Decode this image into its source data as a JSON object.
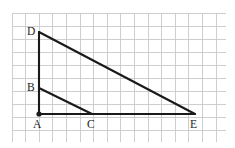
{
  "figure": {
    "background_color": "#ffffff",
    "line_color": "#1a1a1a",
    "grid_color": "#c9c9cc",
    "label_color": "#1d1d1d",
    "grid": {
      "visible": true,
      "x_start": 12,
      "y_start": 13,
      "x_end": 226,
      "y_end": 142,
      "cell_width": 13.6,
      "cell_height": 13.0,
      "columns": 16,
      "rows": 10
    },
    "points": [
      {
        "name": "A",
        "x": 39,
        "y": 114,
        "label": "A",
        "label_x": 33,
        "label_y": 128,
        "marker": "filled-dot",
        "marker_radius": 2.6
      },
      {
        "name": "B",
        "x": 39,
        "y": 88,
        "label": "B",
        "label_x": 27,
        "label_y": 91,
        "marker": "none",
        "marker_radius": 0
      },
      {
        "name": "C",
        "x": 92,
        "y": 114,
        "label": "C",
        "label_x": 87,
        "label_y": 128,
        "marker": "none",
        "marker_radius": 0
      },
      {
        "name": "D",
        "x": 39,
        "y": 32,
        "label": "D",
        "label_x": 27,
        "label_y": 35,
        "marker": "none",
        "marker_radius": 0
      },
      {
        "name": "E",
        "x": 195,
        "y": 114,
        "label": "E",
        "label_x": 190,
        "label_y": 128,
        "marker": "none",
        "marker_radius": 0
      }
    ],
    "segments": [
      {
        "name": "segment-A-D",
        "from": "A",
        "to": "D",
        "x1": 39,
        "y1": 114,
        "x2": 39,
        "y2": 32
      },
      {
        "name": "segment-D-E",
        "from": "D",
        "to": "E",
        "x1": 39,
        "y1": 32,
        "x2": 195,
        "y2": 114
      },
      {
        "name": "segment-A-E",
        "from": "A",
        "to": "E",
        "x1": 39,
        "y1": 114,
        "x2": 195,
        "y2": 114
      },
      {
        "name": "segment-B-C",
        "from": "B",
        "to": "C",
        "x1": 39,
        "y1": 88,
        "x2": 92,
        "y2": 114
      }
    ],
    "triangles": [
      {
        "name": "large-triangle",
        "vertices": "A D E"
      },
      {
        "name": "small-triangle",
        "vertices": "A B C"
      }
    ]
  }
}
